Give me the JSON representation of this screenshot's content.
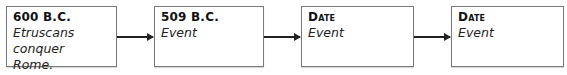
{
  "timeline": {
    "events": [
      {
        "date": "600 B.C.",
        "event": "Etruscans conquer Rome."
      },
      {
        "date": "509 B.C.",
        "event": "Event"
      },
      {
        "date": "Date",
        "event": "Event"
      },
      {
        "date": "Date",
        "event": "Event"
      }
    ]
  }
}
